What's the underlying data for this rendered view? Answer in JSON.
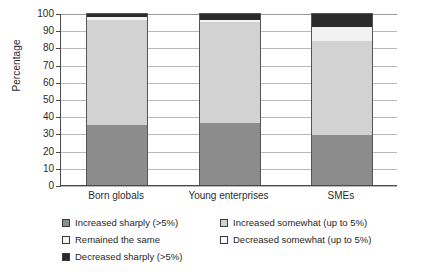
{
  "chart_data": {
    "type": "bar",
    "subtype": "stacked-bar-vertical-100",
    "title": "",
    "xlabel": "",
    "ylabel": "Percentage",
    "ylim": [
      0,
      100
    ],
    "ytick_step": 10,
    "yticks": [
      0,
      10,
      20,
      30,
      40,
      50,
      60,
      70,
      80,
      90,
      100
    ],
    "grid": true,
    "grid_axis": "y",
    "legend_position": "bottom",
    "categories": [
      "Born globals",
      "Young enterprises",
      "SMEs"
    ],
    "series": [
      {
        "name": "Increased sharply (>5%)",
        "color": "#8c8c8c",
        "values": [
          35,
          36,
          29
        ]
      },
      {
        "name": "Increased somewhat (up to 5%)",
        "color": "#d2d2d2",
        "values": [
          61,
          59,
          55
        ]
      },
      {
        "name": "Remained the same",
        "color": "#f2f2f2",
        "values": [
          1.5,
          1,
          8
        ]
      },
      {
        "name": "Decreased somewhat (up to 5%)",
        "color": "#ffffff",
        "values": [
          0,
          0,
          0
        ]
      },
      {
        "name": "Decreased sharply (>5%)",
        "color": "#2b2b2b",
        "values": [
          2.5,
          4,
          8
        ]
      }
    ]
  },
  "axis": {
    "y_title": "Percentage",
    "y_ticks": [
      "100",
      "90",
      "80",
      "70",
      "60",
      "50",
      "40",
      "30",
      "20",
      "10",
      "0"
    ],
    "x_categories": [
      "Born globals",
      "Young enterprises",
      "SMEs"
    ]
  },
  "legend": {
    "column_left": [
      {
        "label": "Increased sharply (>5%)",
        "color": "#8c8c8c"
      },
      {
        "label": "Remained the same",
        "color": "#f2f2f2"
      },
      {
        "label": "Decreased sharply (>5%)",
        "color": "#2b2b2b"
      }
    ],
    "column_right": [
      {
        "label": "Increased somewhat (up to 5%)",
        "color": "#d2d2d2"
      },
      {
        "label": "Decreased somewhat (up to 5%)",
        "color": "#ffffff"
      }
    ]
  }
}
